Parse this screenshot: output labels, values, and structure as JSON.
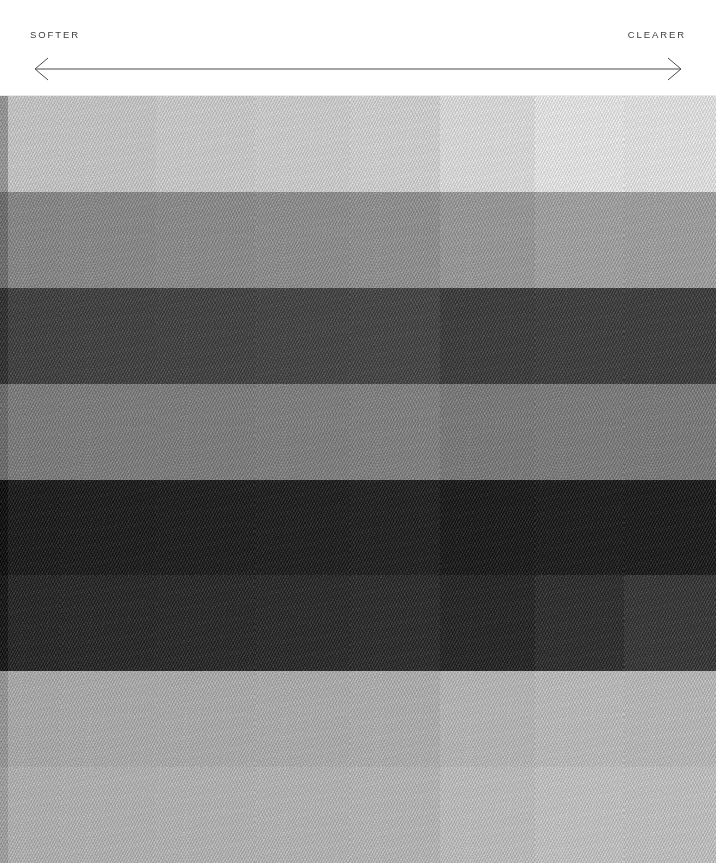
{
  "header": {
    "left_label": "SOFTER",
    "right_label": "CLEARER",
    "arrow_icon": "double-headed-arrow-icon",
    "line_color": "#4a4a4a",
    "text_color": "#3b3b3b",
    "background": "#ffffff",
    "rule_color": "#e9e9e9"
  },
  "grid": {
    "rows": 8,
    "columns": 9,
    "column_widths_px": [
      8,
      52,
      96,
      99,
      95,
      90,
      95,
      89,
      92
    ],
    "top_px": 96,
    "height_px": 767,
    "description": "Grayscale noise-texture tile matrix, luminance varies by row and column",
    "tile_colors": [
      [
        "#9a9a9a",
        "#cdcdcd",
        "#cdcdcd",
        "#d2d2d2",
        "#d5d5d5",
        "#d9d9d9",
        "#e4e4e4",
        "#efefef",
        "#ebebeb"
      ],
      [
        "#6f6f6f",
        "#8a8a8a",
        "#8c8c8c",
        "#8f8f8f",
        "#919191",
        "#949494",
        "#9d9d9d",
        "#a6a6a6",
        "#a3a3a3"
      ],
      [
        "#2e2e2e",
        "#3e3e3e",
        "#3f3f3f",
        "#404040",
        "#424242",
        "#444444",
        "#3a3a3a",
        "#3c3c3c",
        "#3b3b3b"
      ],
      [
        "#6d6d6d",
        "#7e7e7e",
        "#7f7f7f",
        "#808080",
        "#828282",
        "#848484",
        "#7c7c7c",
        "#7e7e7e",
        "#7d7d7d"
      ],
      [
        "#0b0b0b",
        "#171717",
        "#181818",
        "#191919",
        "#1a1a1a",
        "#1c1c1c",
        "#161616",
        "#181818",
        "#171717"
      ],
      [
        "#131313",
        "#232323",
        "#242424",
        "#252525",
        "#262626",
        "#282828",
        "#222222",
        "#2a2a2a",
        "#343434"
      ],
      [
        "#9b9b9b",
        "#b0b0b0",
        "#b1b1b1",
        "#b2b2b2",
        "#b3b3b3",
        "#b5b5b5",
        "#bdbdbd",
        "#c2c2c2",
        "#c0c0c0"
      ],
      [
        "#a4a4a4",
        "#b7b7b7",
        "#b8b8b8",
        "#b9b9b9",
        "#bababa",
        "#bcbcbc",
        "#c4c4c4",
        "#c9c9c9",
        "#c7c7c7"
      ]
    ]
  }
}
